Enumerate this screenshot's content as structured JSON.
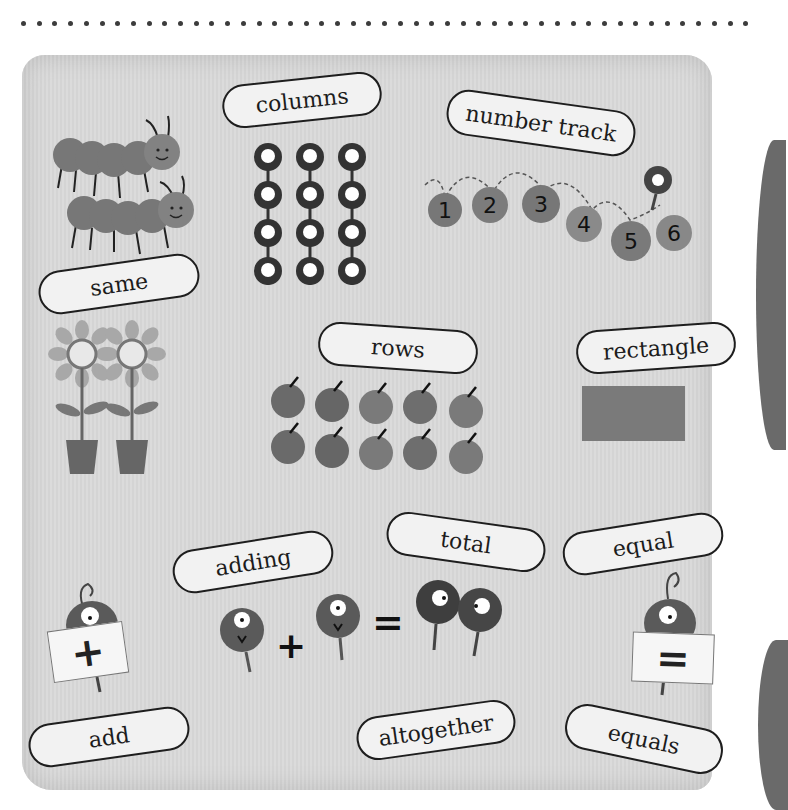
{
  "header": {
    "dot_count": 47
  },
  "labels": [
    {
      "id": "columns",
      "text": "columns",
      "x": 222,
      "y": 78,
      "w": 160,
      "h": 44,
      "rot": -6
    },
    {
      "id": "number-track",
      "text": "number track",
      "x": 446,
      "y": 100,
      "w": 190,
      "h": 46,
      "rot": 8
    },
    {
      "id": "same",
      "text": "same",
      "x": 38,
      "y": 258,
      "w": 162,
      "h": 44,
      "rot": -8
    },
    {
      "id": "rows",
      "text": "rows",
      "x": 318,
      "y": 326,
      "w": 160,
      "h": 44,
      "rot": 4
    },
    {
      "id": "rectangle",
      "text": "rectangle",
      "x": 576,
      "y": 326,
      "w": 160,
      "h": 44,
      "rot": -4
    },
    {
      "id": "adding",
      "text": "adding",
      "x": 172,
      "y": 538,
      "w": 162,
      "h": 44,
      "rot": -9
    },
    {
      "id": "total",
      "text": "total",
      "x": 386,
      "y": 518,
      "w": 160,
      "h": 44,
      "rot": 8
    },
    {
      "id": "equal",
      "text": "equal",
      "x": 562,
      "y": 518,
      "w": 162,
      "h": 44,
      "rot": -9
    },
    {
      "id": "add",
      "text": "add",
      "x": 28,
      "y": 713,
      "w": 162,
      "h": 44,
      "rot": -8
    },
    {
      "id": "altogether",
      "text": "altogether",
      "x": 356,
      "y": 706,
      "w": 160,
      "h": 44,
      "rot": -8
    },
    {
      "id": "equals",
      "text": "equals",
      "x": 564,
      "y": 714,
      "w": 160,
      "h": 46,
      "rot": 12
    }
  ],
  "number_track": {
    "numbers": [
      "1",
      "2",
      "3",
      "4",
      "5",
      "6"
    ]
  },
  "equation": {
    "plus": "+",
    "equals": "="
  },
  "signs": {
    "add_sign": "+",
    "equals_sign": "="
  },
  "colors": {
    "panel": "#d8d8d8",
    "label_bg": "#f2f2f2",
    "ink": "#1e1e1e",
    "creature": "#5a5a5a",
    "rect": "#7a7a7a"
  }
}
